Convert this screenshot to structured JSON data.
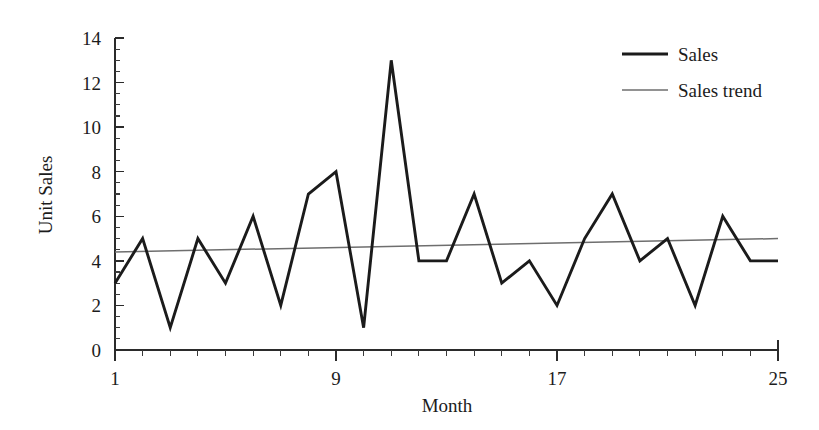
{
  "chart_data": {
    "type": "line",
    "title": "",
    "xlabel": "Month",
    "ylabel": "Unit Sales",
    "xlim": [
      1,
      25
    ],
    "ylim": [
      0,
      14
    ],
    "grid": false,
    "legend_position": "top-right",
    "x": [
      1,
      2,
      3,
      4,
      5,
      6,
      7,
      8,
      9,
      10,
      11,
      12,
      13,
      14,
      15,
      16,
      17,
      18,
      19,
      20,
      21,
      22,
      23,
      24,
      25
    ],
    "series": [
      {
        "name": "Sales",
        "style": "thick-black-line",
        "color": "#1b1b1b",
        "values": [
          3,
          5,
          1,
          5,
          3,
          6,
          2,
          7,
          8,
          1,
          13,
          4,
          4,
          7,
          3,
          4,
          2,
          5,
          7,
          4,
          5,
          2,
          6,
          4,
          4
        ]
      },
      {
        "name": "Sales trend",
        "style": "thin-gray-line",
        "color": "#6e6e6e",
        "values": [
          4.4,
          4.425,
          4.45,
          4.475,
          4.5,
          4.525,
          4.55,
          4.575,
          4.6,
          4.625,
          4.65,
          4.675,
          4.7,
          4.725,
          4.75,
          4.775,
          4.8,
          4.825,
          4.85,
          4.875,
          4.9,
          4.925,
          4.95,
          4.975,
          5.0
        ],
        "endpoints": [
          4.4,
          5.0
        ]
      }
    ],
    "y_ticks_major": [
      0,
      2,
      4,
      6,
      8,
      10,
      12,
      14
    ],
    "y_tick_labels": [
      "0",
      "2",
      "4",
      "6",
      "8",
      "10",
      "12",
      "14"
    ],
    "y_minor_step": 0.5,
    "x_ticks_major": [
      1,
      9,
      17,
      25
    ],
    "x_tick_labels": [
      "1",
      "9",
      "17",
      "25"
    ],
    "x_minor_step": 1,
    "legend": [
      {
        "label": "Sales",
        "swatch": "thick-black-line"
      },
      {
        "label": "Sales trend",
        "swatch": "thin-gray-line"
      }
    ]
  },
  "axes": {
    "y_title": "Unit Sales",
    "x_title": "Month"
  }
}
